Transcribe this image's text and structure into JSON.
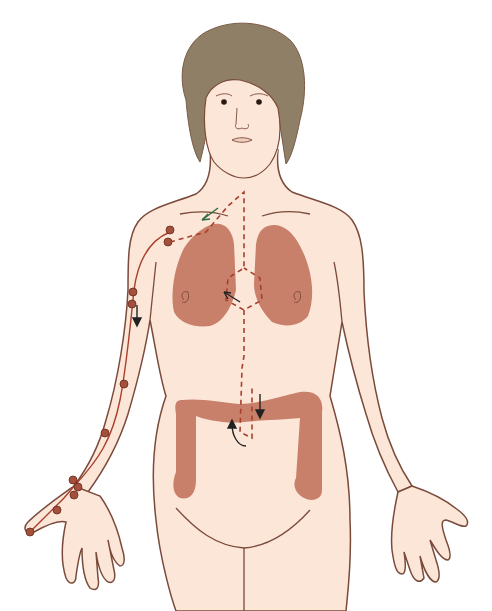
{
  "figure": {
    "organs": [
      "lungs",
      "large-intestine"
    ],
    "meridian": "arm-meridian-with-acupoints",
    "colors": {
      "skin": "#fbe6d8",
      "skin_outline": "#7a4a3a",
      "hair": "#8f7f66",
      "organ": "#c9806a",
      "meridian_line": "#a8402c",
      "acupoint": "#a3503c",
      "arrow_dark": "#222222",
      "arrow_green": "#2f6b3a"
    }
  }
}
